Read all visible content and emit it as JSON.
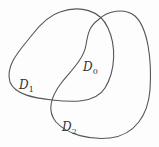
{
  "diagram": {
    "regions": [
      {
        "id": "D1",
        "label": "D",
        "subscript": "1"
      },
      {
        "id": "D0",
        "label": "D",
        "subscript": "0"
      },
      {
        "id": "D2",
        "label": "D",
        "subscript": "2"
      }
    ],
    "stroke_color": "#555555"
  }
}
